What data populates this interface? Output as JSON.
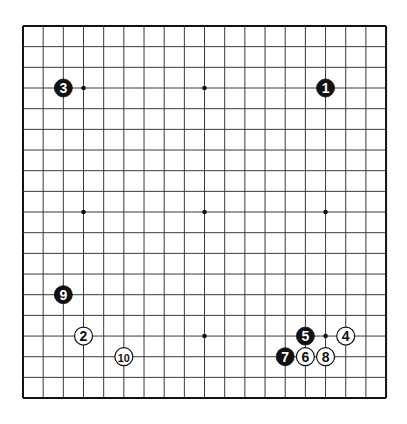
{
  "board": {
    "size": 19,
    "origin_x": 23,
    "origin_y": 26,
    "spacing_x": 20.17,
    "spacing_y": 20.67,
    "line_color": "#3a3a3a",
    "border_color": "#111111",
    "background": "#ffffff",
    "star_points": [
      [
        3,
        3
      ],
      [
        9,
        3
      ],
      [
        15,
        3
      ],
      [
        3,
        9
      ],
      [
        9,
        9
      ],
      [
        15,
        9
      ],
      [
        3,
        15
      ],
      [
        9,
        15
      ],
      [
        15,
        15
      ]
    ]
  },
  "stones": [
    {
      "move": 1,
      "label": "1",
      "color": "black",
      "col": 15,
      "row": 3
    },
    {
      "move": 2,
      "label": "2",
      "color": "white",
      "col": 3,
      "row": 15
    },
    {
      "move": 3,
      "label": "3",
      "color": "black",
      "col": 2,
      "row": 3
    },
    {
      "move": 4,
      "label": "4",
      "color": "white",
      "col": 16,
      "row": 15
    },
    {
      "move": 5,
      "label": "5",
      "color": "black",
      "col": 14,
      "row": 15
    },
    {
      "move": 6,
      "label": "6",
      "color": "white",
      "col": 14,
      "row": 16
    },
    {
      "move": 7,
      "label": "7",
      "color": "black",
      "col": 13,
      "row": 16
    },
    {
      "move": 8,
      "label": "8",
      "color": "white",
      "col": 15,
      "row": 16
    },
    {
      "move": 9,
      "label": "9",
      "color": "black",
      "col": 2,
      "row": 13
    },
    {
      "move": 10,
      "label": "10",
      "color": "white",
      "col": 5,
      "row": 16
    }
  ]
}
